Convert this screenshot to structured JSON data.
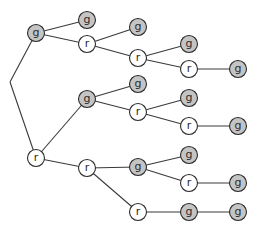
{
  "diagram": {
    "type": "tree",
    "colors": {
      "g_fill": "#c4c4c4",
      "r_fill": "#ffffff",
      "stroke": "#2b2b2b"
    },
    "origin": {
      "x": 10,
      "y": 82
    },
    "nodes": [
      {
        "id": "n1",
        "label": "g",
        "x": 36,
        "y": 33
      },
      {
        "id": "n2",
        "label": "g",
        "x": 87,
        "y": 20
      },
      {
        "id": "n3",
        "label": "r",
        "x": 87,
        "y": 44
      },
      {
        "id": "n4",
        "label": "g",
        "x": 138,
        "y": 27
      },
      {
        "id": "n5",
        "label": "r",
        "x": 138,
        "y": 58
      },
      {
        "id": "n6",
        "label": "g",
        "x": 189,
        "y": 44
      },
      {
        "id": "n7",
        "label": "r",
        "x": 189,
        "y": 69
      },
      {
        "id": "n8",
        "label": "g",
        "x": 238,
        "y": 69
      },
      {
        "id": "n9",
        "label": "r",
        "x": 36,
        "y": 158
      },
      {
        "id": "n10",
        "label": "g",
        "x": 87,
        "y": 99
      },
      {
        "id": "n11",
        "label": "g",
        "x": 138,
        "y": 84
      },
      {
        "id": "n12",
        "label": "r",
        "x": 138,
        "y": 112
      },
      {
        "id": "n13",
        "label": "g",
        "x": 189,
        "y": 98
      },
      {
        "id": "n14",
        "label": "r",
        "x": 189,
        "y": 126
      },
      {
        "id": "n15",
        "label": "g",
        "x": 238,
        "y": 126
      },
      {
        "id": "n16",
        "label": "r",
        "x": 87,
        "y": 168
      },
      {
        "id": "n17",
        "label": "g",
        "x": 138,
        "y": 167
      },
      {
        "id": "n18",
        "label": "g",
        "x": 189,
        "y": 155
      },
      {
        "id": "n19",
        "label": "r",
        "x": 189,
        "y": 183
      },
      {
        "id": "n20",
        "label": "g",
        "x": 238,
        "y": 183
      },
      {
        "id": "n21",
        "label": "r",
        "x": 138,
        "y": 212
      },
      {
        "id": "n22",
        "label": "g",
        "x": 189,
        "y": 212
      },
      {
        "id": "n23",
        "label": "g",
        "x": 238,
        "y": 212
      }
    ],
    "edges": [
      [
        "origin",
        "n1"
      ],
      [
        "origin",
        "n9"
      ],
      [
        "n1",
        "n2"
      ],
      [
        "n1",
        "n3"
      ],
      [
        "n3",
        "n4"
      ],
      [
        "n3",
        "n5"
      ],
      [
        "n5",
        "n6"
      ],
      [
        "n5",
        "n7"
      ],
      [
        "n7",
        "n8"
      ],
      [
        "n9",
        "n10"
      ],
      [
        "n9",
        "n16"
      ],
      [
        "n10",
        "n11"
      ],
      [
        "n10",
        "n12"
      ],
      [
        "n12",
        "n13"
      ],
      [
        "n12",
        "n14"
      ],
      [
        "n14",
        "n15"
      ],
      [
        "n16",
        "n17"
      ],
      [
        "n16",
        "n21"
      ],
      [
        "n17",
        "n18"
      ],
      [
        "n17",
        "n19"
      ],
      [
        "n19",
        "n20"
      ],
      [
        "n21",
        "n22"
      ],
      [
        "n22",
        "n23"
      ]
    ]
  }
}
